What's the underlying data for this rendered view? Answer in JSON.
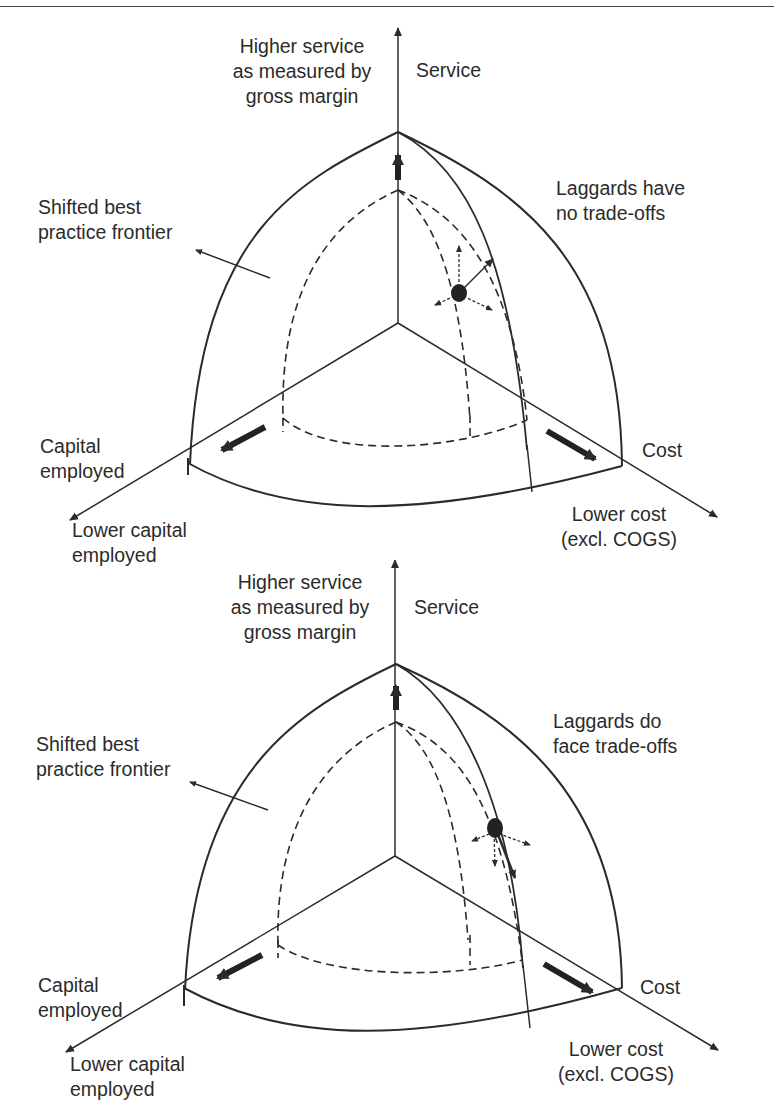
{
  "figure": {
    "panels": [
      {
        "id": "top",
        "axes": {
          "vertical_label": "Service",
          "vertical_desc": "Higher service\nas measured by\ngross margin",
          "left_label": "Capital\nemployed",
          "left_desc": "Lower capital\nemployed",
          "right_label": "Cost",
          "right_desc": "Lower cost\n(excl. COGS)"
        },
        "frontier_label": "Shifted best\npractice frontier",
        "laggard_label": "Laggards have\nno trade-offs"
      },
      {
        "id": "bottom",
        "axes": {
          "vertical_label": "Service",
          "vertical_desc": "Higher service\nas measured by\ngross margin",
          "left_label": "Capital\nemployed",
          "left_desc": "Lower capital\nemployed",
          "right_label": "Cost",
          "right_desc": "Lower cost\n(excl. COGS)"
        },
        "frontier_label": "Shifted best\npractice frontier",
        "laggard_label": "Laggards do\nface trade-offs"
      }
    ],
    "colors": {
      "ink": "#2b2b2b",
      "background": "#ffffff"
    }
  }
}
